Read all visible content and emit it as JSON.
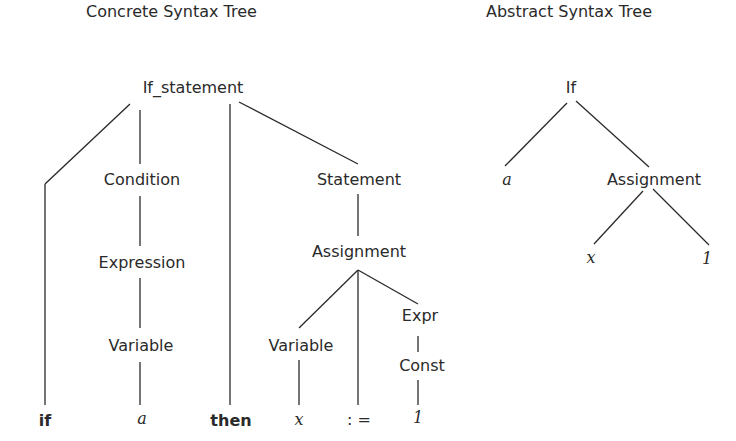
{
  "concrete_tree": {
    "title": "Concrete Syntax Tree",
    "nodes": {
      "if_statement": "If_statement",
      "condition": "Condition",
      "expression": "Expression",
      "variable_a": "Variable",
      "statement": "Statement",
      "assignment": "Assignment",
      "variable_x": "Variable",
      "expr": "Expr",
      "const": "Const"
    },
    "tokens": {
      "if": "if",
      "a": "a",
      "then": "then",
      "x": "x",
      "assign_op": ": =",
      "one": "1"
    }
  },
  "abstract_tree": {
    "title": "Abstract Syntax Tree",
    "nodes": {
      "if": "If",
      "a": "a",
      "assignment": "Assignment",
      "x": "x",
      "one": "1"
    }
  }
}
